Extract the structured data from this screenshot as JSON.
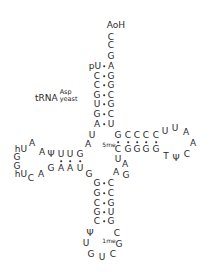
{
  "diagram": {
    "type": "tRNA cloverleaf secondary structure",
    "label": {
      "name": "tRNA",
      "superscript": "Asp",
      "subscript": "yeast"
    },
    "acceptor_stem": {
      "terminal_3prime": "AoH",
      "unpaired_3prime": [
        "C",
        "C",
        "G"
      ],
      "pairs": [
        {
          "left": "pU",
          "right": "A"
        },
        {
          "left": "C",
          "right": "G"
        },
        {
          "left": "C",
          "right": "G"
        },
        {
          "left": "G",
          "right": "C"
        },
        {
          "left": "U",
          "right": "G"
        },
        {
          "left": "G",
          "right": "C"
        },
        {
          "left": "A",
          "right": "U"
        }
      ]
    },
    "junction_left": [
      "U",
      "A"
    ],
    "d_arm": {
      "stem_top": [
        "Ψ",
        "U",
        "U",
        "G"
      ],
      "stem_bottom": [
        "G",
        "A",
        "A",
        "U"
      ],
      "loop": [
        "A",
        "A",
        "hU",
        "G",
        "G",
        "hU",
        "C",
        "A"
      ]
    },
    "variable_loop": [
      "G",
      "A",
      "G",
      "U",
      "A"
    ],
    "t_arm": {
      "stem_top": [
        "G",
        "C",
        "C",
        "C",
        "C"
      ],
      "stem_bottom": [
        "5meC",
        "G",
        "G",
        "G",
        "G"
      ],
      "loop": [
        "U",
        "U",
        "A",
        "A",
        "C",
        "Ψ",
        "T"
      ]
    },
    "anticodon_arm": {
      "pairs": [
        {
          "left": "G",
          "right": "C"
        },
        {
          "left": "G",
          "right": "C"
        },
        {
          "left": "C",
          "right": "G"
        },
        {
          "left": "G",
          "right": "U"
        },
        {
          "left": "C",
          "right": "G"
        }
      ],
      "loop": [
        "Ψ",
        "U",
        "G",
        "U",
        "C",
        "1meG",
        "C"
      ]
    },
    "glyphs": {
      "n_aoh": "AoH",
      "n_c1": "C",
      "n_c2": "C",
      "n_g1": "G",
      "a_l1": "pU",
      "a_r1": "A",
      "a_l2": "C",
      "a_r2": "G",
      "a_l3": "C",
      "a_r3": "G",
      "a_l4": "G",
      "a_r4": "C",
      "a_l5": "U",
      "a_r5": "G",
      "a_l6": "G",
      "a_r6": "C",
      "a_l7": "A",
      "a_r7": "U",
      "j_u": "U",
      "j_a": "A",
      "d_t1": "Ψ",
      "d_t2": "U",
      "d_t3": "U",
      "d_t4": "G",
      "d_b1": "G",
      "d_b2": "A",
      "d_b3": "A",
      "d_b4": "U",
      "d_l1": "A",
      "d_l2": "A",
      "d_l3": "hU",
      "d_l4": "G",
      "d_l5": "G",
      "d_l6": "hU",
      "d_l7": "C",
      "d_l8": "A",
      "v_g": "G",
      "t_t1": "G",
      "t_t2": "C",
      "t_t3": "C",
      "t_t4": "C",
      "t_t5": "C",
      "t_b1_sup": "5me",
      "t_b1": "C",
      "t_b2": "G",
      "t_b3": "G",
      "t_b4": "G",
      "t_b5": "G",
      "t_l1": "U",
      "t_l2": "U",
      "t_l3": "A",
      "t_l4": "A",
      "t_l5": "C",
      "t_l6": "Ψ",
      "t_l7": "T",
      "v_u": "U",
      "v_a1": "A",
      "v_a2": "A",
      "v_g2": "G",
      "ac_l1": "G",
      "ac_r1": "C",
      "ac_l2": "G",
      "ac_r2": "C",
      "ac_l3": "C",
      "ac_r3": "G",
      "ac_l4": "G",
      "ac_r4": "U",
      "ac_l5": "C",
      "ac_r5": "G",
      "ac_p": "Ψ",
      "ac_u": "U",
      "ac_g": "G",
      "ac_u2": "U",
      "ac_c": "C",
      "ac_mg_sup": "1me",
      "ac_mg": "G",
      "ac_c2": "C"
    }
  }
}
